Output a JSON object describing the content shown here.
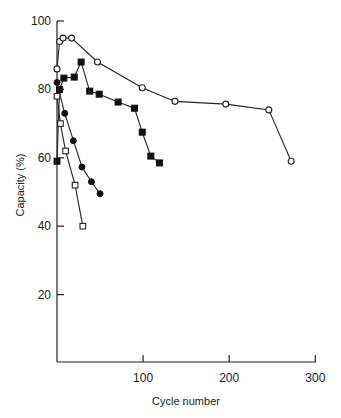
{
  "chart_data": {
    "type": "line",
    "title": "",
    "xlabel": "Cycle number",
    "ylabel": "Capacity (%)",
    "xlim": [
      0,
      300
    ],
    "ylim": [
      0,
      100
    ],
    "xticks": [
      100,
      200,
      300
    ],
    "yticks": [
      20,
      40,
      60,
      80,
      100
    ],
    "grid": false,
    "legend": null,
    "series": [
      {
        "name": "open-circles",
        "marker": "open-circle",
        "x": [
          0,
          3,
          7,
          17,
          47,
          99,
          137,
          196,
          246,
          272
        ],
        "y": [
          86,
          94,
          95,
          95,
          88,
          80.5,
          76.5,
          75.7,
          74,
          59
        ]
      },
      {
        "name": "filled-squares",
        "marker": "filled-square",
        "x": [
          0,
          3,
          8,
          20,
          28,
          38,
          49,
          71,
          90,
          99,
          109,
          119
        ],
        "y": [
          59,
          80,
          83.3,
          83.6,
          88,
          79.5,
          78.6,
          76.3,
          74.5,
          67.5,
          60.5,
          58.5
        ]
      },
      {
        "name": "filled-circles",
        "marker": "filled-circle",
        "x": [
          0,
          9,
          19,
          29,
          40,
          50
        ],
        "y": [
          82,
          73,
          65,
          57.3,
          53,
          49.5
        ]
      },
      {
        "name": "open-squares",
        "marker": "open-square",
        "x": [
          0,
          4,
          10,
          21,
          30
        ],
        "y": [
          78,
          70,
          62,
          52,
          40
        ]
      }
    ]
  },
  "axes": {
    "x_tick_labels": [
      "100",
      "200",
      "300"
    ],
    "y_tick_labels": [
      "20",
      "40",
      "60",
      "80",
      "100"
    ],
    "x_title": "Cycle number",
    "y_title": "Capacity (%)"
  }
}
